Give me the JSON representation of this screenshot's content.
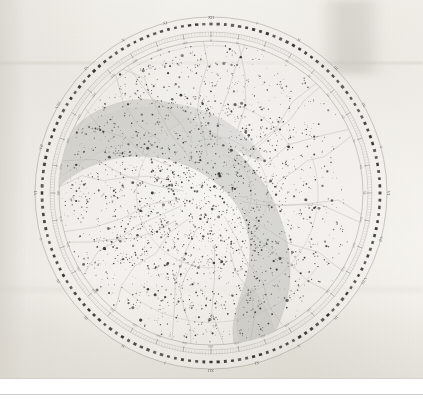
{
  "document": {
    "type": "celestial-planisphere",
    "title": "Star Chart (Northern Celestial Hemisphere Planisphere)",
    "medium": "scanned printed plate on aged paper"
  },
  "chart_data": {
    "type": "scatter",
    "projection": "polar-azimuthal",
    "title": "",
    "xlabel": "",
    "ylabel": "",
    "grid": true,
    "legend_position": "none",
    "center": {
      "x": 211,
      "y": 193
    },
    "radii": {
      "outer_thin_circle": 176,
      "dashed_zodiac_ring": 169,
      "graduation_ring_outer": 161,
      "graduation_ring_inner": 157,
      "map_border_circle": 152
    },
    "colors": {
      "paper": "#f7f6f2",
      "ink": "#2e2d2b",
      "star": "#3a3936",
      "milky_way": "#d6d6d2",
      "milky_way_edge": "#b9b9b3",
      "graticule": "#b2b0a9",
      "ring": "#35342f"
    },
    "rings": {
      "dashed_ring_dash_count": 148,
      "graduation_tick_count": 360,
      "outer_label_count": 24,
      "inner_label_count": 36
    },
    "outer_labels": [
      "XII",
      "I",
      "II",
      "III",
      "IV",
      "V",
      "VI",
      "VII",
      "VIII",
      "IX",
      "X",
      "XI",
      "XII",
      "I",
      "II",
      "III",
      "IV",
      "V",
      "VI",
      "VII",
      "VIII",
      "IX",
      "X",
      "XI"
    ],
    "inner_labels": [
      "0",
      "10",
      "20",
      "30",
      "40",
      "50",
      "60",
      "70",
      "80",
      "90",
      "100",
      "110",
      "120",
      "130",
      "140",
      "150",
      "160",
      "170",
      "180",
      "190",
      "200",
      "210",
      "230",
      "240",
      "250",
      "260",
      "270",
      "280",
      "290",
      "300",
      "310",
      "320",
      "330",
      "340",
      "350",
      "360"
    ],
    "milky_way": {
      "description": "Broad irregular light-grey band crossing the disc from the upper-left limb through the centre-right and down to the lower-right limb, with a bifurcated (split) lobe in the upper-left quadrant.",
      "fill": "#d8d8d4",
      "opacity": 0.85
    },
    "stars": {
      "approximate_count": 2000,
      "magnitude_sizes_px": [
        0.7,
        1.0,
        1.4,
        1.9,
        2.5
      ],
      "densest_region": "centre and lower-centre of the disc",
      "sparsest_region": "outer right limb"
    },
    "constellation_boundaries": {
      "style": "thin faint grey polylines",
      "color": "#bcbab3",
      "count": 26
    }
  },
  "annotations": {
    "visible_text": "perimeter graduation numerals only; too small/blurred to transcribe individually"
  }
}
